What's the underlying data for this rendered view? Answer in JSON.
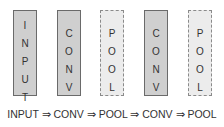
{
  "diagram": {
    "blocks": [
      {
        "label": "INPUT",
        "letters": [
          "I",
          "N",
          "P",
          "U",
          "T"
        ],
        "style": "solid"
      },
      {
        "label": "CONV",
        "letters": [
          "C",
          "O",
          "N",
          "V"
        ],
        "style": "solid"
      },
      {
        "label": "POOL",
        "letters": [
          "P",
          "O",
          "O",
          "L"
        ],
        "style": "dashed"
      },
      {
        "label": "CONV",
        "letters": [
          "C",
          "O",
          "N",
          "V"
        ],
        "style": "solid"
      },
      {
        "label": "POOL",
        "letters": [
          "P",
          "O",
          "O",
          "L"
        ],
        "style": "dashed"
      }
    ],
    "caption": "INPUT ⇒ CONV ⇒ POOL ⇒ CONV ⇒ POOL",
    "colors": {
      "solid_fill": "#cfcfcf",
      "dashed_fill": "#ececec",
      "border": "#6a6a6a"
    }
  }
}
